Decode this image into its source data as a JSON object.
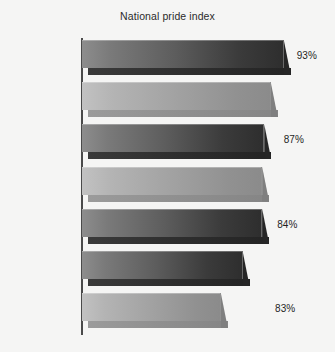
{
  "chart_data": {
    "type": "bar",
    "orientation": "horizontal",
    "title": "National pride index",
    "xlabel": "",
    "ylabel": "",
    "categories": [
      "Americans",
      "Canadians",
      "British",
      "Japanese",
      "Italians",
      "Germans",
      "Russians"
    ],
    "values": [
      93,
      87,
      84,
      83,
      83,
      74,
      64
    ],
    "value_labels": [
      "93%",
      "87%",
      "84%",
      "83%",
      "83%",
      "74%",
      "64%"
    ],
    "unit": "%",
    "xlim": [
      0,
      100
    ],
    "grid": false,
    "legend": null,
    "style": {
      "background": "#f5f5f4",
      "axis_color": "#4a4a4a",
      "text_color": "#262626",
      "bar_shades": [
        "dark",
        "light",
        "dark",
        "light",
        "dark",
        "dark",
        "light"
      ],
      "bar_dark_color": "#4a4a4a",
      "bar_light_color": "#a2a2a2"
    }
  }
}
